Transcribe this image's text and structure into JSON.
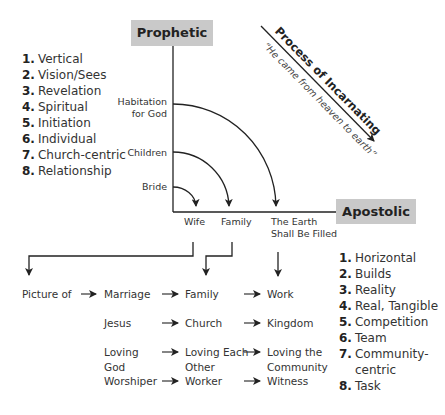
{
  "prophetic": {
    "label": "Prophetic",
    "traits": [
      {
        "num": "1.",
        "text": "Vertical"
      },
      {
        "num": "2.",
        "text": "Vision/Sees"
      },
      {
        "num": "3.",
        "text": "Revelation"
      },
      {
        "num": "4.",
        "text": "Spiritual"
      },
      {
        "num": "5.",
        "text": "Initiation"
      },
      {
        "num": "6.",
        "text": "Individual"
      },
      {
        "num": "7.",
        "text": "Church-centric"
      },
      {
        "num": "8.",
        "text": "Relationship"
      }
    ]
  },
  "apostolic": {
    "label": "Apostolic",
    "traits": [
      {
        "num": "1.",
        "text": "Horizontal"
      },
      {
        "num": "2.",
        "text": "Builds"
      },
      {
        "num": "3.",
        "text": "Reality"
      },
      {
        "num": "4.",
        "text": "Real, Tangible"
      },
      {
        "num": "5.",
        "text": "Competition"
      },
      {
        "num": "6.",
        "text": "Team"
      },
      {
        "num": "7.",
        "text": "Community-"
      },
      {
        "num": "",
        "text": "centric"
      },
      {
        "num": "8.",
        "text": "Task"
      }
    ]
  },
  "process": {
    "title": "Process of Incarnating",
    "subtitle": "“He came from heaven to earth”"
  },
  "axis_labels": {
    "habitation_line1": "Habitation",
    "habitation_line2": "for God",
    "children": "Children",
    "bride": "Bride",
    "wife": "Wife",
    "family": "Family",
    "earth_line1": "The Earth",
    "earth_line2": "Shall Be Filled"
  },
  "rows": [
    {
      "c0": "Picture of",
      "c1": "Marriage",
      "c2": "Family",
      "c3": "Work"
    },
    {
      "c0": "",
      "c1": "Jesus",
      "c2": "Church",
      "c3": "Kingdom"
    },
    {
      "c0": "",
      "c1": "Loving",
      "c1b": "God",
      "c2": "Loving Each",
      "c2b": "Other",
      "c3": "Loving the",
      "c3b": "Community"
    },
    {
      "c0": "",
      "c1": "Worshiper",
      "c2": "Worker",
      "c3": "Witness"
    }
  ],
  "colors": {
    "box_fill": "#c9c9c9",
    "line": "#222222",
    "text": "#333333"
  }
}
